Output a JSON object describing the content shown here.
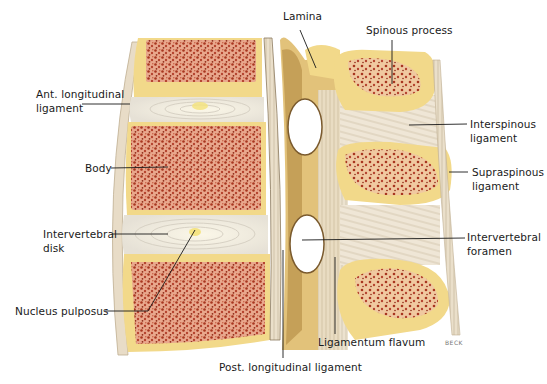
{
  "figure": {
    "signature": "BECK",
    "colors": {
      "bone_cortex": "#f2d98a",
      "cancellous_bone": "#b5432e",
      "marrow_bg": "#e7a088",
      "disk": "#f3f0ea",
      "disk_rings": "#d7d1c4",
      "nucleus": "#f4e27a",
      "ligament": "#e8dcc7",
      "ligament_fibers": "#b8a88e",
      "lamina_shadow": "#b9924a",
      "label_line": "#1a1a1a"
    }
  },
  "labels": {
    "lamina": "Lamina",
    "spinous_process": "Spinous process",
    "ant_longitudinal_ligament": [
      "Ant. longitudinal",
      "ligament"
    ],
    "interspinous_ligament": [
      "Interspinous",
      "ligament"
    ],
    "body": "Body",
    "supraspinous_ligament": [
      "Supraspinous",
      "ligament"
    ],
    "intervertebral_disk": [
      "Intervertebral",
      "disk"
    ],
    "intervertebral_foramen": [
      "Intervertebral",
      "foramen"
    ],
    "nucleus_pulposus": "Nucleus pulposus",
    "ligamentum_flavum": "Ligamentum flavum",
    "post_longitudinal_ligament": "Post. longitudinal ligament"
  }
}
